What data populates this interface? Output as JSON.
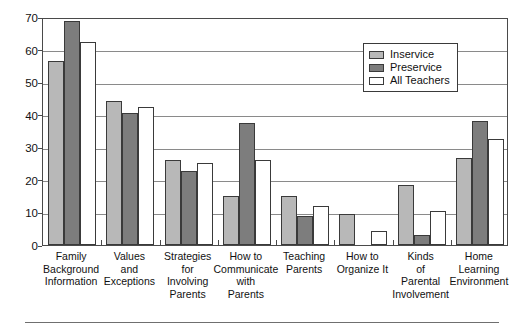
{
  "chart_data": {
    "type": "bar",
    "title": "",
    "subtitle": "",
    "xlabel": "",
    "ylabel": "",
    "ylim": [
      0,
      70
    ],
    "yticks": [
      0,
      10,
      20,
      30,
      40,
      50,
      60,
      70
    ],
    "ytick_labels": [
      "0",
      "10",
      "20",
      "30",
      "40",
      "50",
      "60",
      "70"
    ],
    "grid": true,
    "grid_axis": "y",
    "legend_position": "upper right",
    "categories": [
      "Family Background Information",
      "Values and Exceptions",
      "Strategies for Involving Parents",
      "How to Communicate with Parents",
      "Teaching Parents",
      "How to Organize It",
      "Kinds of Parental Involvement",
      "Home Learning Environment"
    ],
    "category_lines": [
      [
        "Family",
        "Background",
        "Information"
      ],
      [
        "Values",
        "and",
        "Exceptions"
      ],
      [
        "Strategies",
        "for",
        "Involving",
        "Parents"
      ],
      [
        "How to",
        "Communicate",
        "with",
        "Parents"
      ],
      [
        "Teaching",
        "Parents"
      ],
      [
        "How to",
        "Organize It"
      ],
      [
        "Kinds",
        "of",
        "Parental",
        "Involvement"
      ],
      [
        "Home",
        "Learning",
        "Environment"
      ]
    ],
    "series": [
      {
        "name": "Inservice",
        "color": "#b8b8b8",
        "values": [
          56.5,
          44.3,
          26.0,
          15.2,
          15.1,
          9.5,
          18.5,
          26.6
        ]
      },
      {
        "name": "Preservice",
        "color": "#7d7d7d",
        "values": [
          68.8,
          40.5,
          22.8,
          37.4,
          9.0,
          0.0,
          3.0,
          38.0
        ]
      },
      {
        "name": "All Teachers",
        "color": "#ffffff",
        "values": [
          62.2,
          42.3,
          25.1,
          26.2,
          12.1,
          4.4,
          10.4,
          32.4
        ]
      }
    ]
  },
  "legend": {
    "entries": [
      {
        "label": "Inservice",
        "swatch": "inservice"
      },
      {
        "label": "Preservice",
        "swatch": "preservice"
      },
      {
        "label": "All Teachers",
        "swatch": "allteachers"
      }
    ]
  },
  "colors": {
    "inservice": "#b8b8b8",
    "preservice": "#7d7d7d",
    "all_teachers": "#ffffff",
    "axis": "#4a4a4a",
    "gridline": "#8a8a8a",
    "text": "#111111"
  }
}
